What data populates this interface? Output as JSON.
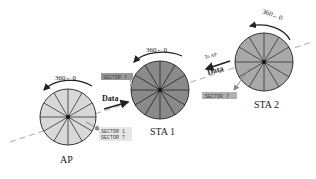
{
  "diagram": {
    "beam_line": {
      "style": "dashed",
      "color": "#aaaaaa"
    },
    "nodes": [
      {
        "id": "ap",
        "label": "AP",
        "fill": "#d8d8d8",
        "rotation_label": "360←0",
        "sector_labels": [
          "SECTOR 1",
          "SECTOR 7"
        ],
        "sector_label_bg": "#e6e6e6"
      },
      {
        "id": "sta1",
        "label": "STA 1",
        "fill": "#8a8a8a",
        "rotation_label": "360←0",
        "sector_labels": [
          "SECTOR 7"
        ],
        "sector_label_bg": "#9a9a9a"
      },
      {
        "id": "sta2",
        "label": "STA 2",
        "fill": "#a9a9a9",
        "rotation_label": "360←0",
        "sector_labels": [
          "SECTOR 7"
        ],
        "sector_label_bg": "#b0b0b0"
      }
    ],
    "arrows": [
      {
        "from": "ap",
        "to": "sta1",
        "label": "Data"
      },
      {
        "from": "sta2",
        "to": "ap",
        "label": "Data",
        "sublabel": "To AP"
      }
    ]
  }
}
